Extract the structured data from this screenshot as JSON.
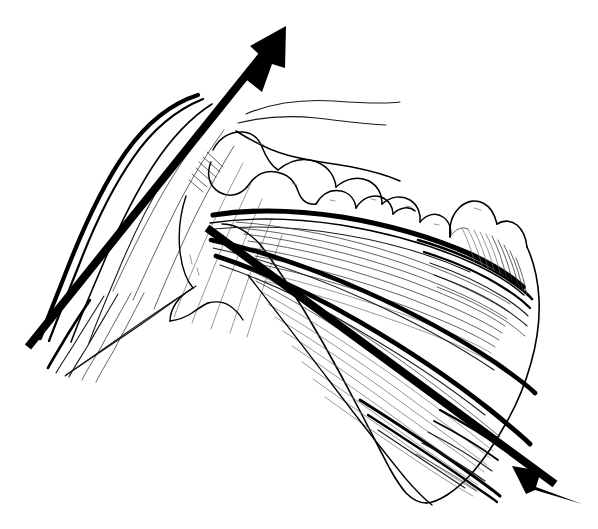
{
  "figure": {
    "title": "Shoulder girdle anatomical line drawing with two force-direction arrows",
    "style": "black-and-white pen-and-ink line art",
    "background_color": "#ffffff",
    "ink_color": "#000000",
    "width": 598,
    "height": 529
  },
  "structures": [
    {
      "id": "deltoid",
      "name": "deltoid-muscle",
      "label": "Deltoid muscle",
      "description": "Large curved muscle belly at upper left, fibers converging inferiorly toward the deltoid tuberosity"
    },
    {
      "id": "clavicle",
      "name": "clavicle",
      "label": "Clavicle",
      "description": "S-shaped bone running from upper centre toward the right"
    },
    {
      "id": "acromion",
      "name": "acromion-process",
      "label": "Acromion",
      "description": "Bony prominence overlying the glenohumeral joint at centre"
    },
    {
      "id": "coracoid",
      "name": "coracoid-process",
      "label": "Coracoid process",
      "description": "Hook-shaped projection anterior to the glenoid"
    },
    {
      "id": "humeral-head",
      "name": "humeral-head",
      "label": "Humeral head",
      "description": "Rounded articular surface below the acromion at left centre"
    },
    {
      "id": "scapular-spine",
      "name": "scapular-spine",
      "label": "Spine of scapula",
      "description": "Heavy dark ridge sweeping from the glenoid toward the medial border"
    },
    {
      "id": "scapula-body",
      "name": "scapula-body",
      "label": "Body of scapula",
      "description": "Triangular blade occupying the right half of the drawing"
    },
    {
      "id": "infraspinatus",
      "name": "infraspinatus-muscle",
      "label": "Infraspinatus muscle",
      "description": "Fan of fibres radiating from the medial border toward the glenoid"
    },
    {
      "id": "teres-minor",
      "name": "teres-minor-muscle",
      "label": "Teres minor muscle",
      "description": "Lower band of fibres along the lateral border"
    },
    {
      "id": "inferior-angle",
      "name": "inferior-angle-of-scapula",
      "label": "Inferior angle",
      "description": "Pointed lower tip of the scapular blade"
    },
    {
      "id": "medial-border",
      "name": "medial-border-of-scapula",
      "label": "Medial border",
      "description": "Right-hand contour of the scapular blade"
    }
  ],
  "annotations": {
    "arrows": [
      {
        "id": "arrow-superior",
        "name": "arrow-superolateral",
        "label": "Superolateral force vector",
        "direction": "up and to the right",
        "tail": {
          "x": 28,
          "y": 347
        },
        "tip": {
          "x": 286,
          "y": 26
        },
        "shaft_width": 8,
        "color": "#000000"
      },
      {
        "id": "arrow-inferior",
        "name": "arrow-inferolateral",
        "label": "Inferolateral force vector",
        "direction": "down and to the right",
        "tail": {
          "x": 207,
          "y": 228
        },
        "tip": {
          "x": 582,
          "y": 504
        },
        "shaft_width": 8,
        "color": "#000000"
      }
    ]
  }
}
